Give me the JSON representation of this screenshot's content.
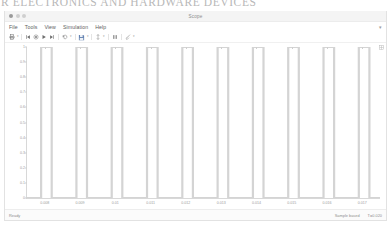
{
  "page_bleed": {
    "text": "R ELECTRONICS AND HARDWARE DEVICES"
  },
  "window": {
    "title": "Scope",
    "traffic_lights": [
      "close-button",
      "minimize-button",
      "zoom-button"
    ]
  },
  "menu": {
    "items": [
      {
        "label": "File",
        "name": "menu-file"
      },
      {
        "label": "Tools",
        "name": "menu-tools"
      },
      {
        "label": "View",
        "name": "menu-view"
      },
      {
        "label": "Simulation",
        "name": "menu-simulation"
      },
      {
        "label": "Help",
        "name": "menu-help"
      }
    ],
    "overflow": "▾"
  },
  "toolbar": {
    "caret": "▾",
    "buttons": [
      {
        "name": "print-button",
        "icon": "printer-icon",
        "caret": true
      },
      {
        "name": "step-back-button",
        "icon": "step-back-icon",
        "caret": false
      },
      {
        "name": "stop-button",
        "icon": "stop-circle-icon",
        "caret": false
      },
      {
        "name": "run-button",
        "icon": "play-icon",
        "caret": false
      },
      {
        "name": "step-forward-button",
        "icon": "step-forward-icon",
        "caret": false
      },
      {
        "name": "restart-button",
        "icon": "restart-arrow-icon",
        "caret": true
      },
      {
        "name": "save-data-button",
        "icon": "save-disk-icon",
        "caret": true
      },
      {
        "name": "cursor-measure-button",
        "icon": "cursor-measure-icon",
        "caret": true
      },
      {
        "name": "signal-select-button",
        "icon": "signal-bars-icon",
        "caret": false
      },
      {
        "name": "style-button",
        "icon": "paintbrush-icon",
        "caret": true
      }
    ],
    "plot_corner_icon": "layout-grid-icon"
  },
  "status": {
    "left": "Ready",
    "sample_mode": "Sample based",
    "time_readout": "T=0.020"
  },
  "chart_data": {
    "type": "line",
    "title": "",
    "xlabel": "",
    "ylabel": "",
    "xlim": [
      0.0075,
      0.0175
    ],
    "ylim": [
      0,
      1
    ],
    "grid": false,
    "legend": false,
    "line_color": "#d4d4d4",
    "xtick_labels": [
      "0.008",
      "0.009",
      "0.01",
      "0.011",
      "0.012",
      "0.013",
      "0.014",
      "0.015",
      "0.016",
      "0.017"
    ],
    "xtick_values": [
      0.008,
      0.009,
      0.01,
      0.011,
      0.012,
      0.013,
      0.014,
      0.015,
      0.016,
      0.017
    ],
    "ytick_labels": [
      "1",
      "0.9",
      "0.8",
      "0.7",
      "0.6",
      "0.5",
      "0.4",
      "0.3",
      "0.2",
      "0.1",
      "0"
    ],
    "ytick_values": [
      1,
      0.9,
      0.8,
      0.7,
      0.6,
      0.5,
      0.4,
      0.3,
      0.2,
      0.1,
      0
    ],
    "series": [
      {
        "name": "pulse-train",
        "waveform": "square",
        "amplitude": 1,
        "low_level": 0,
        "period": 0.001,
        "duty_cycle_pct": 30,
        "pulse_count": 10,
        "x": [
          0.0075,
          0.0079,
          0.0079,
          0.0082,
          0.0082,
          0.0089,
          0.0089,
          0.0092,
          0.0092,
          0.0099,
          0.0099,
          0.0102,
          0.0102,
          0.0109,
          0.0109,
          0.0112,
          0.0112,
          0.0119,
          0.0119,
          0.0122,
          0.0122,
          0.0129,
          0.0129,
          0.0132,
          0.0132,
          0.0139,
          0.0139,
          0.0142,
          0.0142,
          0.0149,
          0.0149,
          0.0152,
          0.0152,
          0.0159,
          0.0159,
          0.0162,
          0.0162,
          0.0169,
          0.0169,
          0.0172,
          0.0172,
          0.0175
        ],
        "y": [
          0,
          0,
          1,
          1,
          0,
          0,
          1,
          1,
          0,
          0,
          1,
          1,
          0,
          0,
          1,
          1,
          0,
          0,
          1,
          1,
          0,
          0,
          1,
          1,
          0,
          0,
          1,
          1,
          0,
          0,
          1,
          1,
          0,
          0,
          1,
          1,
          0,
          0,
          1,
          1,
          0,
          0
        ]
      }
    ]
  }
}
